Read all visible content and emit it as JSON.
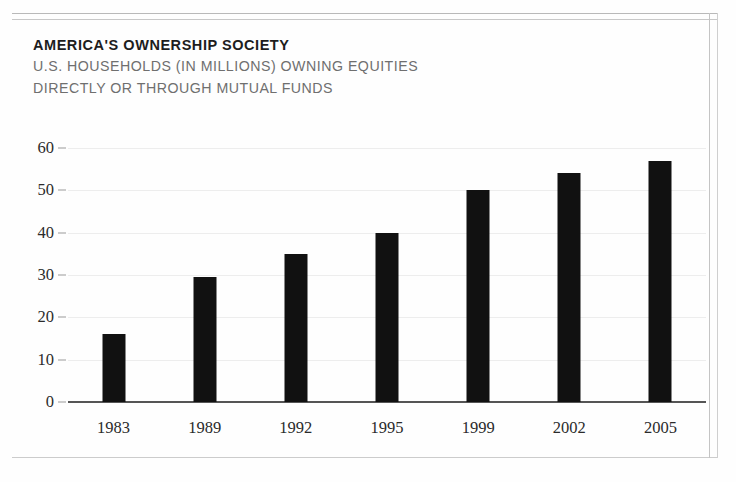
{
  "heading": {
    "title": "AMERICA'S OWNERSHIP SOCIETY",
    "subtitle_line1": "U.S. HOUSEHOLDS (IN MILLIONS) OWNING EQUITIES",
    "subtitle_line2": "DIRECTLY OR THROUGH MUTUAL FUNDS"
  },
  "colors": {
    "bar": "#111111",
    "gridline": "#ededed",
    "axis": "#555555",
    "title": "#1d1d1d",
    "subtitle": "#6f6f6f",
    "frame_rule": "#c4c4c4"
  },
  "chart_data": {
    "type": "bar",
    "title": "AMERICA'S OWNERSHIP SOCIETY",
    "subtitle": "U.S. HOUSEHOLDS (IN MILLIONS) OWNING EQUITIES DIRECTLY OR THROUGH MUTUAL FUNDS",
    "categories": [
      "1983",
      "1989",
      "1992",
      "1995",
      "1999",
      "2002",
      "2005"
    ],
    "values": [
      16,
      29.5,
      35,
      40,
      50,
      54,
      57
    ],
    "xlabel": "",
    "ylabel": "",
    "ylim": [
      0,
      60
    ],
    "yticks": [
      0,
      10,
      20,
      30,
      40,
      50,
      60
    ],
    "ytick_labels": [
      "0",
      "10",
      "20",
      "30",
      "40",
      "50",
      "60"
    ],
    "grid": true,
    "legend": false,
    "units": "millions of households"
  }
}
